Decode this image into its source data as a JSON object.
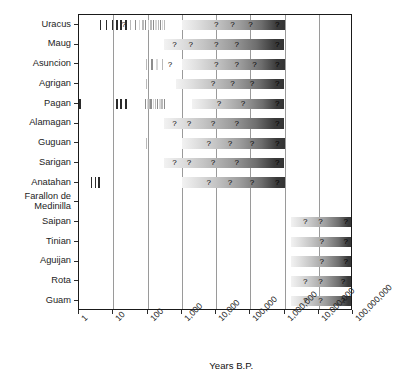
{
  "chart_data": {
    "type": "bar",
    "title": "",
    "xlabel": "Years B.P.",
    "ylabel": "",
    "xscale": "log",
    "xlim": [
      1,
      100000000
    ],
    "grid": true,
    "legend": false,
    "xticklabels": [
      "1",
      "10",
      "100",
      "1,000",
      "10,000",
      "100,000",
      "1,000,000",
      "10,000,000",
      "100,000,000"
    ],
    "xtickvalues": [
      1,
      10,
      100,
      1000,
      10000,
      100000,
      1000000,
      10000000,
      100000000
    ],
    "categories": [
      "Uracus",
      "Maug",
      "Asuncion",
      "Agrigan",
      "Pagan",
      "Alamagan",
      "Guguan",
      "Sarigan",
      "Anatahan",
      "Farallon de Medinilla",
      "Saipan",
      "Tinian",
      "Aguijan",
      "Rota",
      "Guam"
    ],
    "annotation_symbol": "?",
    "series": [
      {
        "name": "Uracus",
        "gradient_band": {
          "start": 1000,
          "end": 1000000
        },
        "dated_events_years_bp": [
          4,
          6,
          9,
          12,
          16,
          22,
          30,
          42,
          55,
          70,
          85,
          100,
          120,
          145,
          170,
          200,
          230,
          260,
          300
        ],
        "question_marks_at": [
          20,
          10000,
          30000,
          100000,
          600000
        ]
      },
      {
        "name": "Maug",
        "gradient_band": {
          "start": 300,
          "end": 1000000
        },
        "dated_events_years_bp": [],
        "question_marks_at": [
          600,
          1800,
          10000,
          40000,
          600000
        ]
      },
      {
        "name": "Asuncion",
        "gradient_band": {
          "start": 1000,
          "end": 1000000
        },
        "dated_events_years_bp": [
          90,
          130,
          180,
          260
        ],
        "question_marks_at": [
          450,
          10000,
          40000,
          130000,
          600000
        ]
      },
      {
        "name": "Agrigan",
        "gradient_band": {
          "start": 700,
          "end": 1000000
        },
        "dated_events_years_bp": [
          90
        ],
        "question_marks_at": [
          8000,
          30000,
          110000,
          600000
        ]
      },
      {
        "name": "Pagan",
        "gradient_band": {
          "start": 2000,
          "end": 1000000
        },
        "dated_events_years_bp": [
          1,
          12,
          16,
          22,
          85,
          95,
          105,
          120,
          140,
          165,
          190,
          220,
          255,
          300
        ],
        "question_marks_at": [
          12000,
          60000,
          600000
        ]
      },
      {
        "name": "Alamagan",
        "gradient_band": {
          "start": 300,
          "end": 1000000
        },
        "dated_events_years_bp": [],
        "question_marks_at": [
          600,
          1600,
          8000,
          40000,
          600000
        ]
      },
      {
        "name": "Guguan",
        "gradient_band": {
          "start": 1000,
          "end": 1000000
        },
        "dated_events_years_bp": [
          90
        ],
        "question_marks_at": [
          6000,
          25000,
          110000,
          600000
        ]
      },
      {
        "name": "Sarigan",
        "gradient_band": {
          "start": 300,
          "end": 1000000
        },
        "dated_events_years_bp": [],
        "question_marks_at": [
          600,
          1600,
          8000,
          40000,
          600000
        ]
      },
      {
        "name": "Anatahan",
        "gradient_band": {
          "start": 1000,
          "end": 1000000
        },
        "dated_events_years_bp": [
          2.2,
          2.9,
          3.7
        ],
        "question_marks_at": [
          6000,
          25000,
          110000,
          600000
        ]
      },
      {
        "name": "Farallon de Medinilla",
        "gradient_band": null,
        "dated_events_years_bp": [],
        "question_marks_at": []
      },
      {
        "name": "Saipan",
        "gradient_band": {
          "start": 1500000,
          "end": 100000000
        },
        "dated_events_years_bp": [],
        "question_marks_at": [
          4000000,
          11000000,
          60000000
        ]
      },
      {
        "name": "Tinian",
        "gradient_band": {
          "start": 1500000,
          "end": 100000000
        },
        "dated_events_years_bp": [],
        "question_marks_at": [
          12000000,
          60000000
        ]
      },
      {
        "name": "Aguijan",
        "gradient_band": {
          "start": 1500000,
          "end": 100000000
        },
        "dated_events_years_bp": [],
        "question_marks_at": [
          12000000,
          60000000
        ]
      },
      {
        "name": "Rota",
        "gradient_band": {
          "start": 1500000,
          "end": 100000000
        },
        "dated_events_years_bp": [],
        "question_marks_at": [
          4000000,
          11000000,
          50000000
        ]
      },
      {
        "name": "Guam",
        "gradient_band": {
          "start": 1500000,
          "end": 100000000
        },
        "dated_events_years_bp": [],
        "question_marks_at": [
          4000000,
          11000000,
          50000000
        ]
      }
    ]
  },
  "axis": {
    "x_title": "Years B.P.",
    "ticks": [
      "1",
      "10",
      "100",
      "1,000",
      "10,000",
      "100,000",
      "1,000,000",
      "10,000,000",
      "100,000,000"
    ]
  },
  "rows": [
    {
      "label": "Uracus"
    },
    {
      "label": "Maug"
    },
    {
      "label": "Asuncion"
    },
    {
      "label": "Agrigan"
    },
    {
      "label": "Pagan"
    },
    {
      "label": "Alamagan"
    },
    {
      "label": "Guguan"
    },
    {
      "label": "Sarigan"
    },
    {
      "label": "Anatahan"
    },
    {
      "label": "Farallon de",
      "label2": "Medinilla"
    },
    {
      "label": "Saipan"
    },
    {
      "label": "Tinian"
    },
    {
      "label": "Aguijan"
    },
    {
      "label": "Rota"
    },
    {
      "label": "Guam"
    }
  ],
  "colors": {
    "frame": "#1a1a1a",
    "gridline": "#9a9a9a",
    "text": "#1d1d1d",
    "bar_dark": "#3a3a3a",
    "bar_light": "#f2f2f2",
    "tick_dark": "#2b2b2b"
  }
}
